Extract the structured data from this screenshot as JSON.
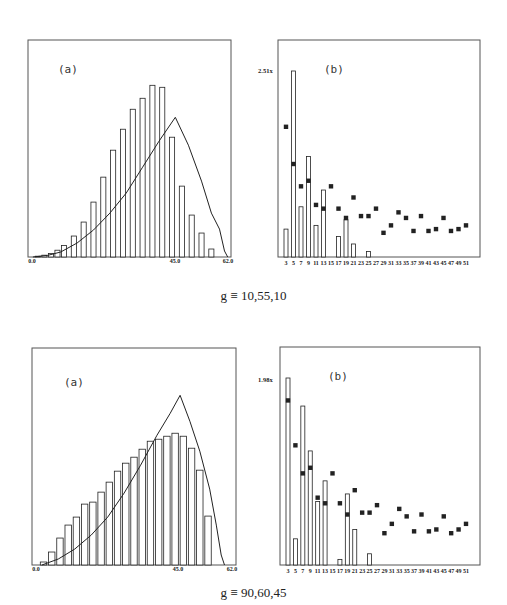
{
  "figure": {
    "rows": [
      {
        "caption": "g ≡ 10,55,10",
        "panel_a": {
          "label": "(a)",
          "xticks": [
            "0.0",
            "45.0",
            "62.0"
          ]
        },
        "panel_b": {
          "label": "(b)",
          "ymax_label": "2.51x"
        }
      },
      {
        "caption": "g ≡ 90,60,45",
        "panel_a": {
          "label": "(a)",
          "xticks": [
            "0.0",
            "45.0",
            "62.0"
          ]
        },
        "panel_b": {
          "label": "(b)",
          "ymax_label": "1.98x"
        }
      }
    ],
    "b_xticks": [
      "3",
      "5",
      "7",
      "9",
      "11",
      "13",
      "15",
      "17",
      "19",
      "21",
      "23",
      "25",
      "27",
      "29",
      "31",
      "33",
      "35",
      "37",
      "39",
      "41",
      "43",
      "45",
      "47",
      "49",
      "51"
    ],
    "colors": {
      "ink": "#222222",
      "frame": "#555555",
      "background": "#ffffff"
    }
  },
  "chart_data": [
    {
      "id": "row1-a",
      "type": "bar",
      "title": "(a)",
      "subtitle": "g ≡ 10,55,10",
      "xlabel": "",
      "ylabel": "",
      "xlim": [
        0,
        62
      ],
      "x_tick_labels": [
        "0.0",
        "45.0",
        "62.0"
      ],
      "bin_centers": [
        4.5,
        7.5,
        10.5,
        13.5,
        16.5,
        19.5,
        22.5,
        25.5,
        28.5,
        31.5,
        34.5,
        37.5,
        40.5,
        43.5,
        46.5,
        49.5,
        52.5,
        55.5,
        58.5
      ],
      "values": [
        0.5,
        1.5,
        3.5,
        6.5,
        10.5,
        16,
        26,
        39,
        52,
        64,
        74,
        84,
        90,
        98,
        97,
        72,
        36,
        21,
        12,
        4
      ],
      "bars": [
        {
          "x": 3.0,
          "h": 0.4
        },
        {
          "x": 5.0,
          "h": 0.9
        },
        {
          "x": 7.0,
          "h": 1.8
        },
        {
          "x": 9.0,
          "h": 3.4
        },
        {
          "x": 11.0,
          "h": 5.8
        },
        {
          "x": 14.0,
          "h": 10.5
        },
        {
          "x": 17.0,
          "h": 17.5
        },
        {
          "x": 20.0,
          "h": 27.5
        },
        {
          "x": 23.0,
          "h": 40.0
        },
        {
          "x": 26.0,
          "h": 53.5
        },
        {
          "x": 29.0,
          "h": 64.0
        },
        {
          "x": 32.0,
          "h": 74.0
        },
        {
          "x": 35.0,
          "h": 79.5
        },
        {
          "x": 38.0,
          "h": 86.0
        },
        {
          "x": 41.0,
          "h": 85.0
        },
        {
          "x": 44.0,
          "h": 60.0
        },
        {
          "x": 47.0,
          "h": 35.5
        },
        {
          "x": 50.0,
          "h": 21.0
        },
        {
          "x": 53.0,
          "h": 12.0
        },
        {
          "x": 56.0,
          "h": 4.0
        }
      ],
      "ylim": [
        0,
        100
      ],
      "curve": [
        [
          1.5,
          0
        ],
        [
          6,
          0.8
        ],
        [
          10,
          2.5
        ],
        [
          15,
          7
        ],
        [
          20,
          13.5
        ],
        [
          25,
          22
        ],
        [
          30,
          32
        ],
        [
          35,
          45
        ],
        [
          40,
          58
        ],
        [
          45,
          70
        ],
        [
          49,
          56
        ],
        [
          53,
          38
        ],
        [
          56,
          22
        ],
        [
          58.5,
          14
        ],
        [
          60,
          3
        ],
        [
          61,
          0
        ]
      ],
      "curve_peak": {
        "x": 45.0,
        "y": 70
      }
    },
    {
      "id": "row1-b",
      "type": "bar",
      "title": "(b)",
      "subtitle": "g ≡ 10,55,10",
      "y_max_label": "2.51x",
      "categories": [
        3,
        5,
        7,
        9,
        11,
        13,
        15,
        17,
        19,
        21,
        23,
        25,
        27,
        29,
        31,
        33,
        35,
        37,
        39,
        41,
        43,
        45,
        47,
        49,
        51
      ],
      "series": [
        {
          "name": "bars",
          "values": [
            15,
            100,
            27,
            54,
            17,
            36,
            0,
            11,
            20,
            7,
            0,
            3,
            0,
            0,
            0,
            0,
            0,
            0,
            0,
            0,
            0,
            0,
            0,
            0,
            0
          ]
        },
        {
          "name": "points",
          "values": [
            70,
            50,
            38,
            41,
            28,
            26,
            38,
            26,
            21,
            32,
            22,
            22,
            26,
            13,
            17,
            24,
            21,
            14,
            22,
            14,
            15,
            21,
            14,
            15,
            17
          ]
        }
      ],
      "ylim": [
        0,
        100
      ]
    },
    {
      "id": "row2-a",
      "type": "bar",
      "title": "(a)",
      "subtitle": "g ≡ 90,60,45",
      "xlabel": "",
      "ylabel": "",
      "xlim": [
        0,
        62
      ],
      "x_tick_labels": [
        "0.0",
        "45.0",
        "62.0"
      ],
      "bars": [
        {
          "x": 3.5,
          "h": 1.5
        },
        {
          "x": 6.0,
          "h": 6.5
        },
        {
          "x": 8.5,
          "h": 13.5
        },
        {
          "x": 11.0,
          "h": 20.0
        },
        {
          "x": 13.5,
          "h": 24.0
        },
        {
          "x": 16.0,
          "h": 30.5
        },
        {
          "x": 18.5,
          "h": 31.5
        },
        {
          "x": 21.0,
          "h": 36.5
        },
        {
          "x": 23.5,
          "h": 41.5
        },
        {
          "x": 26.0,
          "h": 47.0
        },
        {
          "x": 28.5,
          "h": 51.0
        },
        {
          "x": 31.0,
          "h": 54.0
        },
        {
          "x": 33.5,
          "h": 58.0
        },
        {
          "x": 36.0,
          "h": 62.0
        },
        {
          "x": 38.5,
          "h": 63.0
        },
        {
          "x": 41.0,
          "h": 64.5
        },
        {
          "x": 43.5,
          "h": 66.0
        },
        {
          "x": 46.0,
          "h": 64.5
        },
        {
          "x": 48.5,
          "h": 58.5
        },
        {
          "x": 51.0,
          "h": 47.5
        },
        {
          "x": 53.5,
          "h": 24.5
        }
      ],
      "ylim": [
        0,
        100
      ],
      "curve": [
        [
          3,
          0
        ],
        [
          8,
          3
        ],
        [
          13,
          8
        ],
        [
          18,
          15
        ],
        [
          23,
          24
        ],
        [
          28,
          36
        ],
        [
          33,
          50
        ],
        [
          38,
          65
        ],
        [
          42,
          76
        ],
        [
          45,
          85
        ],
        [
          48,
          72
        ],
        [
          51,
          57
        ],
        [
          54,
          38
        ],
        [
          56,
          20
        ],
        [
          57.5,
          5
        ],
        [
          58.5,
          0
        ]
      ],
      "curve_peak": {
        "x": 45.0,
        "y": 85
      }
    },
    {
      "id": "row2-b",
      "type": "bar",
      "title": "(b)",
      "subtitle": "g ≡ 90,60,45",
      "y_max_label": "1.98x",
      "categories": [
        3,
        5,
        7,
        9,
        11,
        13,
        15,
        17,
        19,
        21,
        23,
        25,
        27,
        29,
        31,
        33,
        35,
        37,
        39,
        41,
        43,
        45,
        47,
        49,
        51
      ],
      "series": [
        {
          "name": "bars",
          "values": [
            100,
            14,
            85,
            61,
            34,
            45,
            0,
            3,
            38,
            19,
            0,
            6,
            0,
            0,
            0,
            0,
            0,
            0,
            0,
            0,
            0,
            0,
            0,
            0,
            0
          ]
        },
        {
          "name": "points",
          "values": [
            88,
            64,
            49,
            52,
            36,
            33,
            49,
            33,
            27,
            40,
            28,
            28,
            32,
            17,
            22,
            30,
            26,
            18,
            27,
            18,
            19,
            26,
            17,
            19,
            22
          ]
        }
      ],
      "ylim": [
        0,
        100
      ]
    }
  ]
}
